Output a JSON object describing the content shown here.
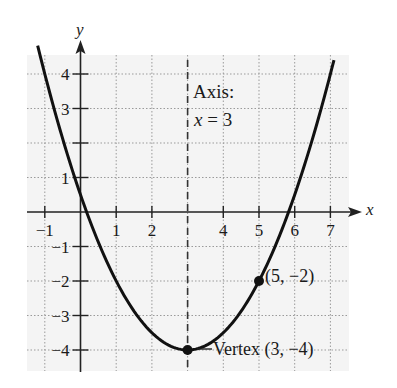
{
  "chart_data": {
    "type": "line",
    "title": "",
    "function": "f(x) = 0.5(x - 3)^2 - 4",
    "xlabel": "x",
    "ylabel": "y",
    "xlim": [
      -1.5,
      7.8
    ],
    "ylim": [
      -4.5,
      4.9
    ],
    "grid": true,
    "x_ticks": [
      -1,
      1,
      2,
      4,
      5,
      6,
      7
    ],
    "x_tick_labels": [
      "−1",
      "1",
      "2",
      "4",
      "5",
      "6",
      "7"
    ],
    "y_ticks": [
      4,
      3,
      1,
      -1,
      -2,
      -3,
      -4
    ],
    "y_tick_labels": [
      "4",
      "3",
      "1",
      "−1",
      "−2",
      "−3",
      "−4"
    ],
    "series": [
      {
        "name": "parabola",
        "x": [
          -1.2,
          -1,
          0,
          0.17,
          1,
          2,
          3,
          4,
          5,
          5.83,
          6,
          7,
          7.1
        ],
        "values": [
          4.82,
          4,
          0.5,
          0,
          -2,
          -3.5,
          -4,
          -3.5,
          -2,
          0,
          0.5,
          4,
          4.4
        ]
      }
    ],
    "points": [
      {
        "x": 3,
        "y": -4,
        "label": "Vertex (3, −4)"
      },
      {
        "x": 5,
        "y": -2,
        "label": "(5, −2)"
      }
    ],
    "axis_of_symmetry": {
      "x": 3,
      "label_line1": "Axis:",
      "label_line2_var": "x",
      "label_line2_rest": " = 3"
    },
    "annotations": [
      "Axis: x = 3",
      "(5, −2)",
      "—Vertex (3, −4)"
    ]
  },
  "labels": {
    "axis_text": "Axis:",
    "axis_eq_var": "x",
    "axis_eq_rest": " = 3",
    "point_label": "(5, −2)",
    "vertex_label": "Vertex (3, −4)",
    "x_axis_name": "x",
    "y_axis_name": "y"
  },
  "style": {
    "curve_color": "#111111",
    "grid_color": "#9a9a9a",
    "axis_color": "#222222",
    "background_shade": "#f4f4f4"
  }
}
